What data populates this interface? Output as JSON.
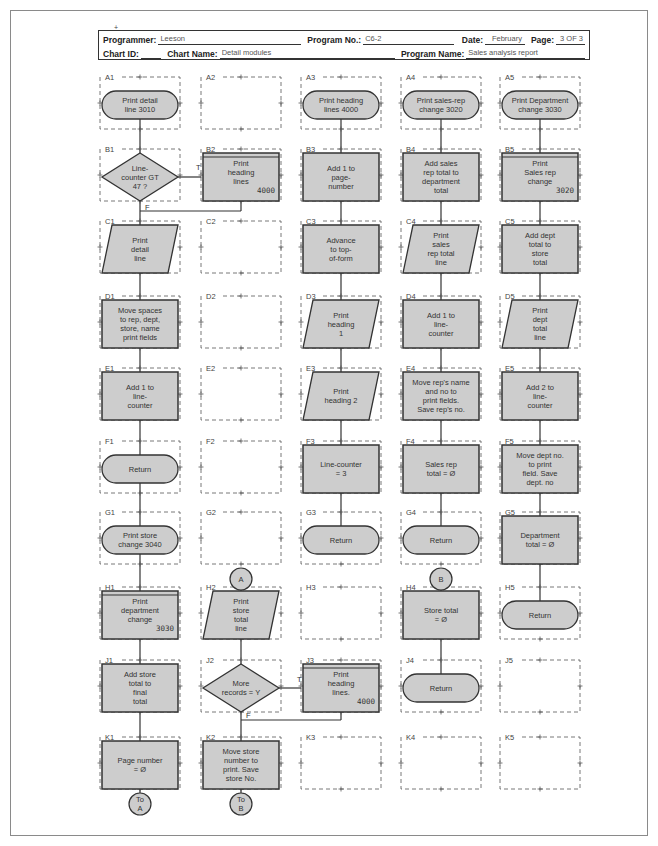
{
  "header": {
    "programmer_label": "Programmer:",
    "programmer": "Leeson",
    "program_no_label": "Program No.:",
    "program_no": "C6-2",
    "date_label": "Date:",
    "date": "February",
    "page_label": "Page:",
    "page": "3 OF 3",
    "chart_id_label": "Chart ID:",
    "chart_id": "",
    "chart_name_label": "Chart Name:",
    "chart_name": "Detail modules",
    "program_name_label": "Program Name:",
    "program_name": "Sales analysis report"
  },
  "grid": {
    "columns": [
      "1",
      "2",
      "3",
      "4",
      "5"
    ],
    "rows": [
      "A",
      "B",
      "C",
      "D",
      "E",
      "F",
      "G",
      "H",
      "J",
      "K"
    ]
  },
  "cells": {
    "A1": {
      "label": "A1",
      "shape": "terminal",
      "lines": [
        "Print detail",
        "line 3010"
      ]
    },
    "A2": {
      "label": "A2",
      "shape": "empty"
    },
    "A3": {
      "label": "A3",
      "shape": "terminal",
      "lines": [
        "Print heading",
        "lines 4000"
      ]
    },
    "A4": {
      "label": "A4",
      "shape": "terminal",
      "lines": [
        "Print sales-rep",
        "change 3020"
      ]
    },
    "A5": {
      "label": "A5",
      "shape": "terminal",
      "lines": [
        "Print Department",
        "change 3030"
      ]
    },
    "B1": {
      "label": "B1",
      "shape": "decision",
      "lines": [
        "Line-",
        "counter GT",
        "47 ?"
      ]
    },
    "B2": {
      "label": "B2",
      "shape": "predefined",
      "lines": [
        "Print",
        "heading",
        "lines"
      ],
      "module": "4000"
    },
    "B3": {
      "label": "B3",
      "shape": "process",
      "lines": [
        "Add 1 to",
        "page-",
        "number"
      ]
    },
    "B4": {
      "label": "B4",
      "shape": "process",
      "lines": [
        "Add sales",
        "rep total to",
        "department",
        "total"
      ]
    },
    "B5": {
      "label": "B5",
      "shape": "predefined",
      "lines": [
        "Print",
        "Sales rep",
        "change"
      ],
      "module": "3020"
    },
    "C1": {
      "label": "C1",
      "shape": "io",
      "lines": [
        "Print",
        "detail",
        "line"
      ]
    },
    "C2": {
      "label": "C2",
      "shape": "empty"
    },
    "C3": {
      "label": "C3",
      "shape": "process",
      "lines": [
        "Advance",
        "to top-",
        "of-form"
      ]
    },
    "C4": {
      "label": "C4",
      "shape": "io",
      "lines": [
        "Print",
        "sales",
        "rep total",
        "line"
      ]
    },
    "C5": {
      "label": "C5",
      "shape": "process",
      "lines": [
        "Add dept",
        "total to",
        "store",
        "total"
      ]
    },
    "D1": {
      "label": "D1",
      "shape": "process",
      "lines": [
        "Move spaces",
        "to rep, dept,",
        "store, name",
        "print fields"
      ]
    },
    "D2": {
      "label": "D2",
      "shape": "empty"
    },
    "D3": {
      "label": "D3",
      "shape": "io",
      "lines": [
        "Print",
        "heading",
        "1"
      ]
    },
    "D4": {
      "label": "D4",
      "shape": "process",
      "lines": [
        "Add 1 to",
        "line-",
        "counter"
      ]
    },
    "D5": {
      "label": "D5",
      "shape": "io",
      "lines": [
        "Print",
        "dept",
        "total",
        "line"
      ]
    },
    "E1": {
      "label": "E1",
      "shape": "process",
      "lines": [
        "Add 1 to",
        "line-",
        "counter"
      ]
    },
    "E2": {
      "label": "E2",
      "shape": "empty"
    },
    "E3": {
      "label": "E3",
      "shape": "io",
      "lines": [
        "Print",
        "heading 2"
      ]
    },
    "E4": {
      "label": "E4",
      "shape": "process",
      "lines": [
        "Move rep's name",
        "and no to",
        "print fields.",
        "Save rep's no."
      ]
    },
    "E5": {
      "label": "E5",
      "shape": "process",
      "lines": [
        "Add 2 to",
        "line-",
        "counter"
      ]
    },
    "F1": {
      "label": "F1",
      "shape": "terminal",
      "lines": [
        "Return"
      ]
    },
    "F2": {
      "label": "F2",
      "shape": "empty"
    },
    "F3": {
      "label": "F3",
      "shape": "process",
      "lines": [
        "Line-counter",
        "= 3"
      ]
    },
    "F4": {
      "label": "F4",
      "shape": "process",
      "lines": [
        "Sales rep",
        "total = Ø"
      ]
    },
    "F5": {
      "label": "F5",
      "shape": "process",
      "lines": [
        "Move dept no.",
        "to print",
        "field. Save",
        "dept. no"
      ]
    },
    "G1": {
      "label": "G1",
      "shape": "terminal",
      "lines": [
        "Print store",
        "change 3040"
      ]
    },
    "G2": {
      "label": "G2",
      "shape": "empty"
    },
    "G3": {
      "label": "G3",
      "shape": "terminal",
      "lines": [
        "Return"
      ]
    },
    "G4": {
      "label": "G4",
      "shape": "terminal",
      "lines": [
        "Return"
      ]
    },
    "G5": {
      "label": "G5",
      "shape": "process",
      "lines": [
        "Department",
        "total = Ø"
      ]
    },
    "H1": {
      "label": "H1",
      "shape": "predefined",
      "lines": [
        "Print",
        "department",
        "change"
      ],
      "module": "3030"
    },
    "H2": {
      "label": "H2",
      "shape": "io",
      "lines": [
        "Print",
        "store",
        "total",
        "line"
      ]
    },
    "H3": {
      "label": "H3",
      "shape": "empty"
    },
    "H4": {
      "label": "H4",
      "shape": "process",
      "lines": [
        "Store total",
        "= Ø"
      ]
    },
    "H5": {
      "label": "H5",
      "shape": "terminal",
      "lines": [
        "Return"
      ]
    },
    "J1": {
      "label": "J1",
      "shape": "process",
      "lines": [
        "Add store",
        "total to",
        "final",
        "total"
      ]
    },
    "J2": {
      "label": "J2",
      "shape": "decision",
      "lines": [
        "More",
        "records = Y"
      ]
    },
    "J3": {
      "label": "J3",
      "shape": "predefined",
      "lines": [
        "Print",
        "heading",
        "lines."
      ],
      "module": "4000"
    },
    "J4": {
      "label": "J4",
      "shape": "terminal",
      "lines": [
        "Return"
      ]
    },
    "J5": {
      "label": "J5",
      "shape": "empty"
    },
    "K1": {
      "label": "K1",
      "shape": "process",
      "lines": [
        "Page number",
        "= Ø"
      ]
    },
    "K2": {
      "label": "K2",
      "shape": "process",
      "lines": [
        "Move store",
        "number to",
        "print. Save",
        "store No."
      ]
    },
    "K3": {
      "label": "K3",
      "shape": "empty"
    },
    "K4": {
      "label": "K4",
      "shape": "empty"
    },
    "K5": {
      "label": "K5",
      "shape": "empty"
    }
  },
  "connectors": {
    "A_entry": {
      "label": "A",
      "at": "above H2"
    },
    "B_entry": {
      "label": "B",
      "at": "above H4"
    },
    "to_A": {
      "lines": [
        "To",
        "A"
      ],
      "at": "below K1"
    },
    "to_B": {
      "lines": [
        "To",
        "B"
      ],
      "at": "below K2"
    }
  },
  "branch_labels": {
    "B1_true": "T",
    "B1_false": "F",
    "J2_true": "T",
    "J2_false": "F"
  },
  "colors": {
    "shape_fill": "#cdcdcd",
    "shape_stroke": "#333333",
    "cell_dash": "#555555",
    "page_border": "#8a8a8a"
  }
}
